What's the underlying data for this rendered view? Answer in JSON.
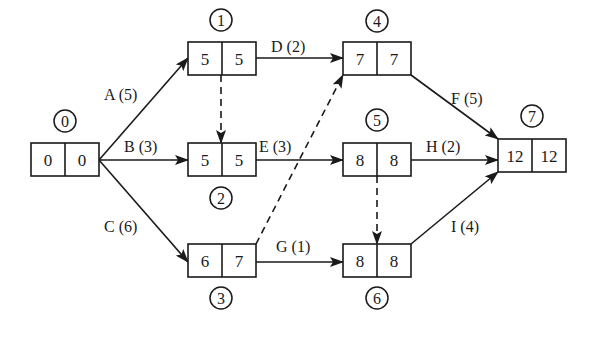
{
  "diagram": {
    "type": "activity-on-node network (precedence diagram)",
    "colors": {
      "stroke": "#1a1a1a",
      "background": "#ffffff"
    },
    "nodes": [
      {
        "id": "0",
        "es": "0",
        "ls": "0",
        "box": [
          31,
          143
        ],
        "circle": [
          65,
          121
        ]
      },
      {
        "id": "1",
        "es": "5",
        "ls": "5",
        "box": [
          188,
          42
        ],
        "circle": [
          221,
          20
        ]
      },
      {
        "id": "2",
        "es": "5",
        "ls": "5",
        "box": [
          188,
          143
        ],
        "circle": [
          221,
          198
        ]
      },
      {
        "id": "3",
        "es": "6",
        "ls": "7",
        "box": [
          188,
          244
        ],
        "circle": [
          221,
          298
        ]
      },
      {
        "id": "4",
        "es": "7",
        "ls": "7",
        "box": [
          343,
          42
        ],
        "circle": [
          377,
          21
        ]
      },
      {
        "id": "5",
        "es": "8",
        "ls": "8",
        "box": [
          343,
          143
        ],
        "circle": [
          377,
          120
        ]
      },
      {
        "id": "6",
        "es": "8",
        "ls": "8",
        "box": [
          343,
          244
        ],
        "circle": [
          377,
          298
        ]
      },
      {
        "id": "7",
        "es": "12",
        "ls": "12",
        "box": [
          498,
          139
        ],
        "circle": [
          532,
          116
        ]
      }
    ],
    "activities": [
      {
        "label": "A (5)",
        "from": "0",
        "to": "1",
        "dashed": false
      },
      {
        "label": "B (3)",
        "from": "0",
        "to": "2",
        "dashed": false
      },
      {
        "label": "C (6)",
        "from": "0",
        "to": "3",
        "dashed": false
      },
      {
        "label": "D (2)",
        "from": "1",
        "to": "4",
        "dashed": false
      },
      {
        "label": "E (3)",
        "from": "2",
        "to": "5",
        "dashed": false
      },
      {
        "label": "G (1)",
        "from": "3",
        "to": "6",
        "dashed": false
      },
      {
        "label": "F (5)",
        "from": "4",
        "to": "7",
        "dashed": false
      },
      {
        "label": "H (2)",
        "from": "5",
        "to": "7",
        "dashed": false
      },
      {
        "label": "I (4)",
        "from": "6",
        "to": "7",
        "dashed": false
      },
      {
        "label": "",
        "from": "1",
        "to": "2",
        "dashed": true
      },
      {
        "label": "",
        "from": "3",
        "to": "4",
        "dashed": true
      },
      {
        "label": "",
        "from": "5",
        "to": "6",
        "dashed": true
      }
    ]
  }
}
